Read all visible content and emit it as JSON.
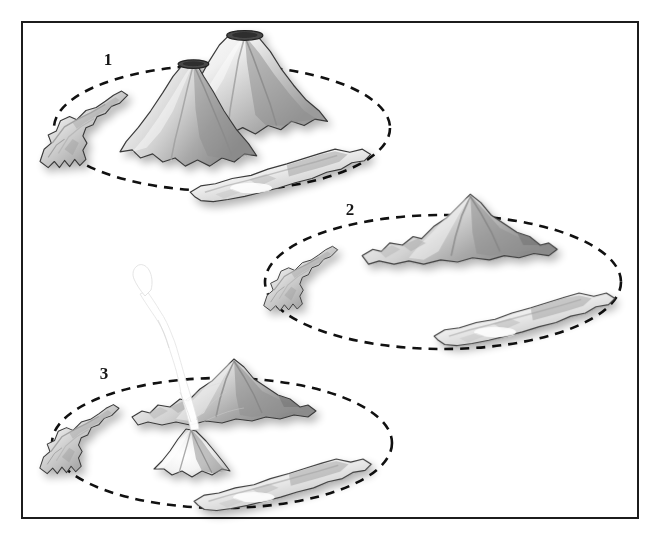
{
  "figure": {
    "kind": "scientific-illustration",
    "title_visible": false,
    "background_color": "#ffffff",
    "frame": {
      "stroke_color": "#1c1c1c",
      "stroke_width": 2,
      "x": 22,
      "y": 22,
      "width": 616,
      "height": 496
    },
    "ink_color": "#2b2b2b",
    "dash_color": "#111111",
    "terrain_light": "#f4f4f4",
    "terrain_mid": "#bdbdbd",
    "terrain_dark": "#7d7d7d",
    "plume_color": "#ffffff"
  },
  "stages": [
    {
      "label": "1",
      "label_x": 108,
      "label_y": 65,
      "caption_visible": false,
      "ring": {
        "name": "caldera-ring-outline",
        "cx": 222,
        "cy": 128,
        "rx": 168,
        "ry": 63,
        "style": "dashed"
      },
      "features": [
        "large-volcanic-cone-with-summit-crater",
        "second-volcanic-cone-with-summit-crater",
        "west-ridge-island",
        "southeast-elongated-island"
      ]
    },
    {
      "label": "2",
      "label_x": 350,
      "label_y": 215,
      "caption_visible": false,
      "ring": {
        "name": "caldera-ring-outline",
        "cx": 443,
        "cy": 282,
        "rx": 178,
        "ry": 67,
        "style": "dashed"
      },
      "features": [
        "collapsed-ridge-landmass-north",
        "west-ridge-island",
        "southeast-elongated-island"
      ]
    },
    {
      "label": "3",
      "label_x": 104,
      "label_y": 379,
      "caption_visible": false,
      "ring": {
        "name": "caldera-ring-outline",
        "cx": 222,
        "cy": 443,
        "rx": 170,
        "ry": 65,
        "style": "dashed"
      },
      "features": [
        "collapsed-ridge-landmass-north",
        "west-ridge-island",
        "southeast-elongated-island",
        "new-central-cone",
        "eruption-plume"
      ]
    }
  ]
}
